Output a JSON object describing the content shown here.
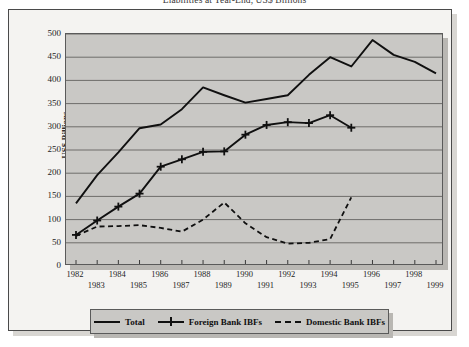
{
  "chart_title": "Liabilities at Year-End, US$ Billions",
  "axes": {
    "y_title": "US$ Billions",
    "y_ticks": [
      500,
      450,
      400,
      350,
      300,
      250,
      200,
      150,
      100,
      50,
      0
    ],
    "x_ticks_top": [
      1982,
      1984,
      1986,
      1988,
      1990,
      1992,
      1994,
      1996,
      1998
    ],
    "x_ticks_bottom": [
      1983,
      1985,
      1987,
      1989,
      1991,
      1993,
      1995,
      1997,
      1999
    ]
  },
  "legend": {
    "items": [
      {
        "label": "Total",
        "key": "solid-line",
        "color": "#101010"
      },
      {
        "label": "Foreign Bank IBFs",
        "key": "plus-marker-line",
        "color": "#101010"
      },
      {
        "label": "Domestic Bank IBFs",
        "key": "dashed-line",
        "color": "#101010"
      }
    ]
  },
  "chart_data": {
    "type": "line",
    "title": "Liabilities at Year-End, US$ Billions",
    "xlabel": "",
    "ylabel": "US$ Billions",
    "ylim": [
      0,
      500
    ],
    "xlim": [
      1982,
      1999
    ],
    "grid": true,
    "legend_position": "bottom",
    "x": [
      1982,
      1983,
      1984,
      1985,
      1986,
      1987,
      1988,
      1989,
      1990,
      1991,
      1992,
      1993,
      1994,
      1995,
      1996,
      1997,
      1998,
      1999
    ],
    "series": [
      {
        "name": "Total",
        "style": "solid",
        "color": "#101010",
        "values": [
          135,
          196,
          245,
          297,
          305,
          338,
          385,
          368,
          352,
          360,
          368,
          412,
          450,
          430,
          487,
          455,
          440,
          415
        ]
      },
      {
        "name": "Foreign Bank IBFs",
        "style": "solid-with-plus-markers",
        "color": "#101010",
        "values": [
          67,
          98,
          128,
          156,
          214,
          230,
          246,
          247,
          283,
          304,
          310,
          308,
          325,
          298,
          null,
          null,
          null,
          null
        ]
      },
      {
        "name": "Domestic Bank IBFs",
        "style": "dashed",
        "color": "#101010",
        "values": [
          65,
          85,
          86,
          88,
          82,
          74,
          100,
          137,
          92,
          62,
          48,
          50,
          58,
          148,
          null,
          null,
          null,
          null
        ]
      }
    ]
  }
}
